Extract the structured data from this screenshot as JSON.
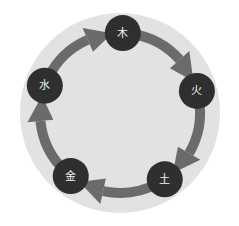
{
  "diagram": {
    "direction": "clockwise",
    "colors": {
      "background": "#ffffff",
      "disc": "#e2e2e2",
      "arrow": "#6b6b6b",
      "node": "#2f2f2f",
      "label": "#f2f2f2"
    },
    "nodes": [
      {
        "id": "wood",
        "label": "木"
      },
      {
        "id": "fire",
        "label": "火"
      },
      {
        "id": "earth",
        "label": "土"
      },
      {
        "id": "metal",
        "label": "金"
      },
      {
        "id": "water",
        "label": "水"
      }
    ],
    "edges": [
      {
        "from": "wood",
        "to": "fire"
      },
      {
        "from": "fire",
        "to": "earth"
      },
      {
        "from": "earth",
        "to": "metal"
      },
      {
        "from": "metal",
        "to": "water"
      },
      {
        "from": "water",
        "to": "wood"
      }
    ]
  }
}
